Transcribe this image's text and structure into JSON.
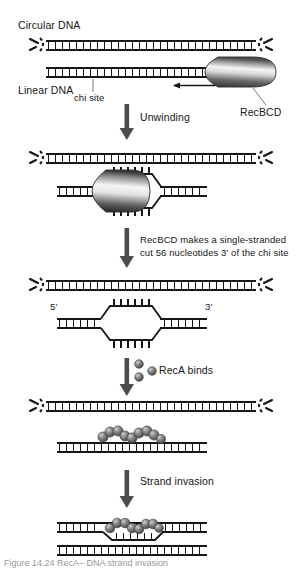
{
  "figure": {
    "title_alt": "RecBCD-mediated homologous recombination pathway",
    "labels": {
      "circular_dna": "Circular DNA",
      "linear_dna": "Linear DNA",
      "chi_site": "chi site",
      "recbcd": "RecBCD",
      "step_unwinding": "Unwinding",
      "step_cut_line1": "RecBCD makes a single-stranded",
      "step_cut_line2": "cut 56 nucleotides 3′ of the chi site",
      "step_reca": "RecA binds",
      "step_strand_invasion": "Strand invasion",
      "five_prime": "5′",
      "three_prime": "3′"
    },
    "caption": "Figure  14.24   RecA– DNA  strand  invasion"
  },
  "colors": {
    "ink": "#161616",
    "dna_rail": "#1a1a1a",
    "protein_dark": "#3a3a3a",
    "protein_light": "#f2f2f2",
    "reca_sphere": "#6e6e6e",
    "reca_sphere_dark": "#4a4a4a",
    "arrow": "#4d4d4d",
    "leader": "#555555",
    "caption_gray": "#9a9a9a",
    "background": "#ffffff"
  },
  "steps": [
    {
      "id": "step-1",
      "name": "initial-pairing",
      "arrow_label": "Unwinding"
    },
    {
      "id": "step-2",
      "name": "unwinding",
      "arrow_label": "RecBCD makes a single-stranded cut 56 nucleotides 3′ of the chi site"
    },
    {
      "id": "step-3",
      "name": "single-strand-cut",
      "arrow_label": "RecA binds"
    },
    {
      "id": "step-4",
      "name": "reca-filament",
      "arrow_label": "Strand invasion"
    },
    {
      "id": "step-5",
      "name": "strand-invasion",
      "arrow_label": ""
    }
  ]
}
